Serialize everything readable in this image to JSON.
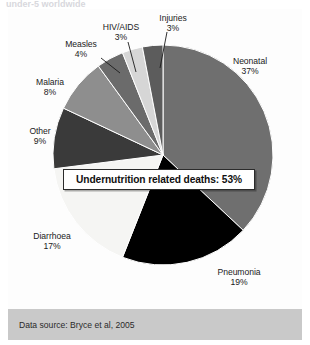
{
  "caption_sliver": "under-5 worldwide",
  "callout": {
    "text": "Undernutrition related deaths: 53%"
  },
  "footer": {
    "source_text": "Data source: Bryce et al, 2005"
  },
  "labels": {
    "neonatal": {
      "name": "Neonatal",
      "pct": "37%"
    },
    "pneumonia": {
      "name": "Pneumonia",
      "pct": "19%"
    },
    "diarrhoea": {
      "name": "Diarrhoea",
      "pct": "17%"
    },
    "other": {
      "name": "Other",
      "pct": "9%"
    },
    "malaria": {
      "name": "Malaria",
      "pct": "8%"
    },
    "measles": {
      "name": "Measles",
      "pct": "4%"
    },
    "hivaids": {
      "name": "HIV/AIDS",
      "pct": "3%"
    },
    "injuries": {
      "name": "Injuries",
      "pct": "3%"
    }
  },
  "chart_data": {
    "type": "pie",
    "title": "",
    "annotation": "Undernutrition related deaths: 53%",
    "source": "Data source: Bryce et al, 2005",
    "legend": "none",
    "start_angle_deg": 0,
    "direction": "clockwise",
    "center": {
      "x": 155,
      "y": 146
    },
    "radius": 110,
    "categories": [
      "Neonatal",
      "Pneumonia",
      "Diarrhoea",
      "Other",
      "Malaria",
      "Measles",
      "HIV/AIDS",
      "Injuries"
    ],
    "values": [
      37,
      19,
      17,
      9,
      8,
      4,
      3,
      3
    ],
    "unit": "percent",
    "colors": [
      "#6f6f6f",
      "#000000",
      "#f5f5f3",
      "#3a3a3a",
      "#8e8e8e",
      "#6b6b6b",
      "#d6d6d6",
      "#5c5c5c"
    ],
    "slice_border_color": "#ffffff",
    "slices": [
      {
        "label": "Neonatal",
        "value": 37,
        "color": "#6f6f6f"
      },
      {
        "label": "Pneumonia",
        "value": 19,
        "color": "#000000"
      },
      {
        "label": "Diarrhoea",
        "value": 17,
        "color": "#f5f5f3"
      },
      {
        "label": "Other",
        "value": 9,
        "color": "#3a3a3a"
      },
      {
        "label": "Malaria",
        "value": 8,
        "color": "#8e8e8e"
      },
      {
        "label": "Measles",
        "value": 4,
        "color": "#6b6b6b"
      },
      {
        "label": "HIV/AIDS",
        "value": 3,
        "color": "#d6d6d6"
      },
      {
        "label": "Injuries",
        "value": 3,
        "color": "#5c5c5c"
      }
    ]
  }
}
